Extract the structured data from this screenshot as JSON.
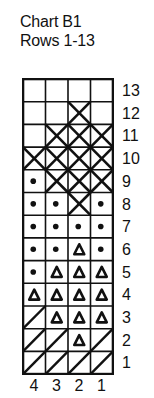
{
  "title": {
    "line1": "Chart B1",
    "line2": "Rows 1-13"
  },
  "symbols": {
    "blank": "empty",
    "x": "cross",
    "dot": "dot",
    "tri": "triangle",
    "slash": "diagonal-slash"
  },
  "column_labels": [
    "4",
    "3",
    "2",
    "1"
  ],
  "rows": [
    {
      "label": "13",
      "cells": [
        "blank",
        "blank",
        "blank",
        "blank"
      ]
    },
    {
      "label": "12",
      "cells": [
        "blank",
        "blank",
        "x",
        "blank"
      ]
    },
    {
      "label": "11",
      "cells": [
        "blank",
        "x",
        "x",
        "x"
      ]
    },
    {
      "label": "10",
      "cells": [
        "x",
        "x",
        "x",
        "x"
      ]
    },
    {
      "label": "9",
      "cells": [
        "dot",
        "x",
        "x",
        "x"
      ]
    },
    {
      "label": "8",
      "cells": [
        "dot",
        "dot",
        "x",
        "dot"
      ]
    },
    {
      "label": "7",
      "cells": [
        "dot",
        "dot",
        "dot",
        "dot"
      ]
    },
    {
      "label": "6",
      "cells": [
        "dot",
        "dot",
        "tri",
        "dot"
      ]
    },
    {
      "label": "5",
      "cells": [
        "dot",
        "tri",
        "tri",
        "tri"
      ]
    },
    {
      "label": "4",
      "cells": [
        "tri",
        "tri",
        "tri",
        "tri"
      ]
    },
    {
      "label": "3",
      "cells": [
        "slash",
        "tri",
        "tri",
        "tri"
      ]
    },
    {
      "label": "2",
      "cells": [
        "slash",
        "slash",
        "tri",
        "slash"
      ]
    },
    {
      "label": "1",
      "cells": [
        "slash",
        "slash",
        "slash",
        "slash"
      ]
    }
  ],
  "colors": {
    "ink": "#111111",
    "background": "#ffffff"
  }
}
